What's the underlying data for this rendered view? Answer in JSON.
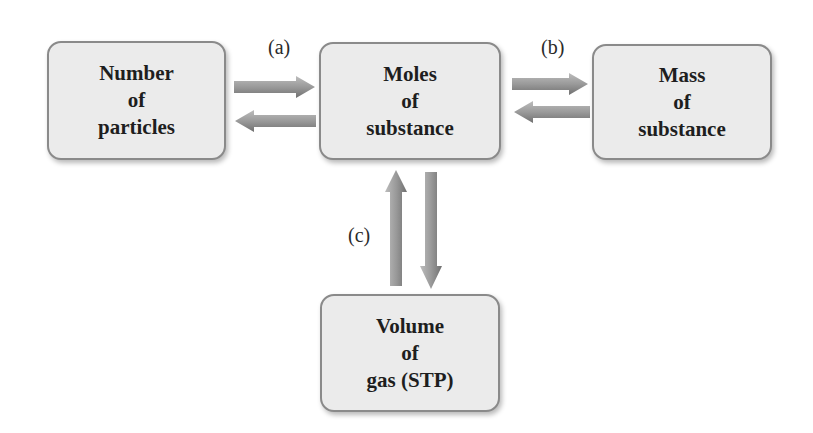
{
  "diagram": {
    "type": "flow",
    "nodes": [
      {
        "id": "particles",
        "lines": [
          "Number",
          "of",
          "particles"
        ]
      },
      {
        "id": "moles",
        "lines": [
          "Moles",
          "of",
          "substance"
        ]
      },
      {
        "id": "mass",
        "lines": [
          "Mass",
          "of",
          "substance"
        ]
      },
      {
        "id": "volume",
        "lines": [
          "Volume",
          "of",
          "gas (STP)"
        ]
      }
    ],
    "edges": [
      {
        "from": "particles",
        "to": "moles",
        "label": "(a)"
      },
      {
        "from": "moles",
        "to": "particles",
        "label": "(a)"
      },
      {
        "from": "moles",
        "to": "mass",
        "label": "(b)"
      },
      {
        "from": "mass",
        "to": "moles",
        "label": "(b)"
      },
      {
        "from": "volume",
        "to": "moles",
        "label": "(c)"
      },
      {
        "from": "moles",
        "to": "volume",
        "label": "(c)"
      }
    ],
    "labels": {
      "a": "(a)",
      "b": "(b)",
      "c": "(c)"
    },
    "colors": {
      "box_fill": "#ebebeb",
      "box_border": "#8a8a8a",
      "arrow_light": "#b4b4b4",
      "arrow_dark": "#7a7a7a",
      "text": "#1e1e1e"
    }
  }
}
